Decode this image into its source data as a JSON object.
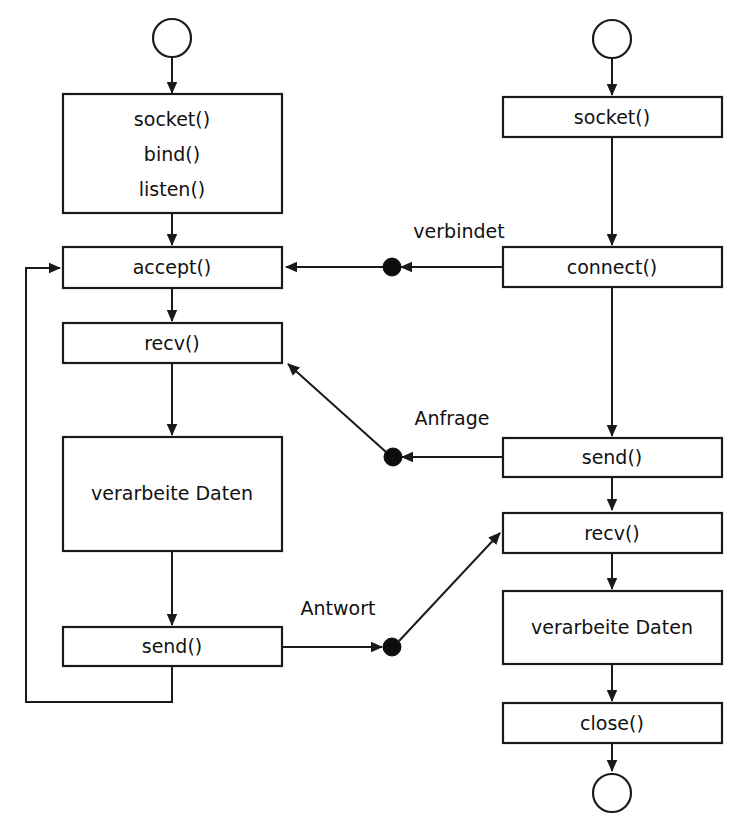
{
  "diagram": {
    "type": "flowchart",
    "stroke_color": "#1a1a1a",
    "fill_color": "#ffffff",
    "junction_color": "#0d0d0d",
    "columns": [
      {
        "id": "server",
        "role": "server",
        "nodes": [
          {
            "id": "srv-start",
            "kind": "start-circle",
            "label": ""
          },
          {
            "id": "srv-init",
            "kind": "process",
            "label": "",
            "lines": [
              "socket()",
              "bind()",
              "listen()"
            ]
          },
          {
            "id": "srv-accept",
            "kind": "process",
            "label": "accept()"
          },
          {
            "id": "srv-recv",
            "kind": "process",
            "label": "recv()"
          },
          {
            "id": "srv-process",
            "kind": "process",
            "label": "verarbeite Daten"
          },
          {
            "id": "srv-send",
            "kind": "process",
            "label": "send()"
          }
        ]
      },
      {
        "id": "client",
        "role": "client",
        "nodes": [
          {
            "id": "cli-start",
            "kind": "start-circle",
            "label": ""
          },
          {
            "id": "cli-socket",
            "kind": "process",
            "label": "socket()"
          },
          {
            "id": "cli-connect",
            "kind": "process",
            "label": "connect()"
          },
          {
            "id": "cli-send",
            "kind": "process",
            "label": "send()"
          },
          {
            "id": "cli-recv",
            "kind": "process",
            "label": "recv()"
          },
          {
            "id": "cli-process",
            "kind": "process",
            "label": "verarbeite Daten"
          },
          {
            "id": "cli-close",
            "kind": "process",
            "label": "close()"
          },
          {
            "id": "cli-end",
            "kind": "end-circle",
            "label": ""
          }
        ]
      }
    ],
    "edge_labels": [
      {
        "id": "lbl-verbindet",
        "text": "verbindet"
      },
      {
        "id": "lbl-anfrage",
        "text": "Anfrage"
      },
      {
        "id": "lbl-antwort",
        "text": "Antwort"
      }
    ],
    "node_text": {
      "srv_init_line1": "socket()",
      "srv_init_line2": "bind()",
      "srv_init_line3": "listen()",
      "srv_accept": "accept()",
      "srv_recv": "recv()",
      "srv_process": "verarbeite Daten",
      "srv_send": "send()",
      "cli_socket": "socket()",
      "cli_connect": "connect()",
      "cli_send": "send()",
      "cli_recv": "recv()",
      "cli_process": "verarbeite Daten",
      "cli_close": "close()"
    }
  }
}
